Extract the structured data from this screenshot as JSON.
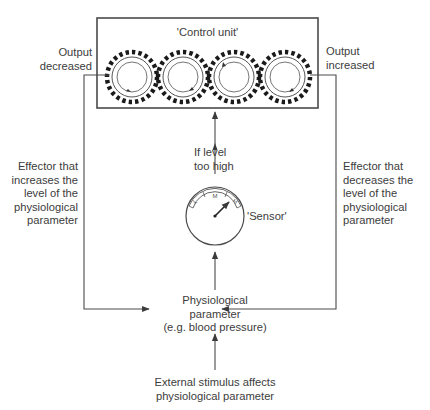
{
  "diagram": {
    "type": "negative-feedback-loop",
    "colors": {
      "line": "#4a4a4a",
      "text": "#3c3c3c",
      "background": "#ffffff"
    },
    "control_unit": {
      "label": "'Control unit'",
      "gear_count": 4
    },
    "output_decreased": {
      "line1": "Output",
      "line2": "decreased"
    },
    "output_increased": {
      "line1": "Output",
      "line2": "increased"
    },
    "effector_left": {
      "line1": "Effector that",
      "line2": "increases the",
      "line3": "level of the",
      "line4": "physiological",
      "line5": "parameter"
    },
    "effector_right": {
      "line1": "Effector that",
      "line2": "decreases the",
      "line3": "level of the",
      "line4": "physiological",
      "line5": "parameter"
    },
    "condition": {
      "line1": "If level",
      "line2": "too high"
    },
    "sensor": {
      "label": "'Sensor'",
      "scale": [
        "L",
        "M",
        "H"
      ]
    },
    "parameter": {
      "line1": "Physiological",
      "line2": "parameter",
      "line3": "(e.g. blood pressure)"
    },
    "stimulus": {
      "line1": "External stimulus affects",
      "line2": "physiological parameter"
    }
  }
}
